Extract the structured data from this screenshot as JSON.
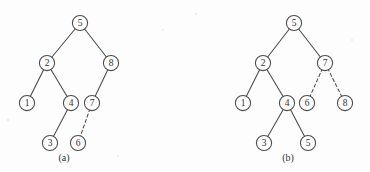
{
  "figure": {
    "background_color": "#fdfdfd",
    "stroke_color": "#4a4a4a",
    "text_color": "#2f2f2f",
    "node_radius": 7.6,
    "panels": [
      {
        "id": "panel-a",
        "caption": "(a)",
        "caption_x": 64,
        "caption_y": 159,
        "nodes": [
          {
            "label": "5",
            "x": 80,
            "y": 23
          },
          {
            "label": "2",
            "x": 47,
            "y": 63
          },
          {
            "label": "8",
            "x": 111,
            "y": 63
          },
          {
            "label": "1",
            "x": 27,
            "y": 103
          },
          {
            "label": "4",
            "x": 71,
            "y": 103
          },
          {
            "label": "7",
            "x": 92,
            "y": 103
          },
          {
            "label": "3",
            "x": 50,
            "y": 143
          },
          {
            "label": "6",
            "x": 78,
            "y": 143
          }
        ],
        "edges": [
          {
            "from": "5",
            "to": "2",
            "style": "solid"
          },
          {
            "from": "5",
            "to": "8",
            "style": "solid"
          },
          {
            "from": "2",
            "to": "1",
            "style": "solid"
          },
          {
            "from": "2",
            "to": "4",
            "style": "solid"
          },
          {
            "from": "8",
            "to": "7",
            "style": "solid"
          },
          {
            "from": "4",
            "to": "3",
            "style": "solid"
          },
          {
            "from": "7",
            "to": "6",
            "style": "dashed"
          }
        ]
      },
      {
        "id": "panel-b",
        "caption": "(b)",
        "caption_x": 288,
        "caption_y": 159,
        "nodes": [
          {
            "label": "5",
            "x": 294,
            "y": 23
          },
          {
            "label": "2",
            "x": 263,
            "y": 63
          },
          {
            "label": "7",
            "x": 325,
            "y": 63
          },
          {
            "label": "1",
            "x": 243,
            "y": 103
          },
          {
            "label": "4",
            "x": 287,
            "y": 103
          },
          {
            "label": "6",
            "x": 307,
            "y": 103
          },
          {
            "label": "8",
            "x": 345,
            "y": 103
          },
          {
            "label": "3",
            "x": 264,
            "y": 143
          },
          {
            "label": "5",
            "x": 308,
            "y": 143
          }
        ],
        "edges": [
          {
            "from": "5",
            "to": "2",
            "style": "solid"
          },
          {
            "from": "5",
            "to": "7",
            "style": "solid"
          },
          {
            "from": "2",
            "to": "1",
            "style": "solid"
          },
          {
            "from": "2",
            "to": "4",
            "style": "solid"
          },
          {
            "from": "7",
            "to": "6",
            "style": "dashed"
          },
          {
            "from": "7",
            "to": "8",
            "style": "dashed"
          },
          {
            "from": "4",
            "to": "3",
            "style": "solid"
          },
          {
            "from": "4",
            "to": "5b",
            "style": "solid"
          }
        ]
      }
    ]
  }
}
